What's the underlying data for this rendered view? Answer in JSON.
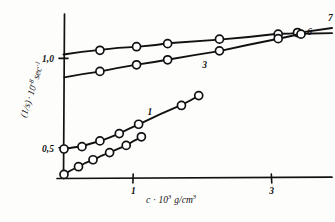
{
  "chart_data": {
    "type": "line",
    "title": "",
    "subtitle": "",
    "xlabel": "c · 10³ g/cm³",
    "ylabel": "(1/s) · 10⁻⁸ sec⁻¹",
    "xlabel_parts": {
      "c": "c",
      "dot": "·",
      "ten": "10",
      "exp": "3",
      "units": "g/cm",
      "units_exp": "3"
    },
    "ylabel_parts": {
      "frac": "(1/s)",
      "dot": "·",
      "ten": "10",
      "exp": "-8",
      "units": "sec",
      "units_exp": "-1"
    },
    "xlim": [
      0,
      3.85
    ],
    "ylim": [
      0.33,
      1.24
    ],
    "xticks": [
      1,
      3
    ],
    "xtick_labels": [
      "1",
      "3"
    ],
    "yticks": [
      0.5,
      1.0
    ],
    "ytick_labels": [
      "0,5",
      "1,0"
    ],
    "grid": false,
    "legend": "inline-end-labels",
    "series": [
      {
        "name": "7",
        "label": "7",
        "label_x": 3.82,
        "label_y": 1.205,
        "points": [
          {
            "x": 0.0,
            "y": 1.022
          },
          {
            "x": 0.52,
            "y": 1.043
          },
          {
            "x": 1.05,
            "y": 1.063
          },
          {
            "x": 1.5,
            "y": 1.08
          },
          {
            "x": 2.25,
            "y": 1.105
          },
          {
            "x": 3.1,
            "y": 1.133
          },
          {
            "x": 3.38,
            "y": 1.142
          }
        ]
      },
      {
        "name": "6",
        "label": "6",
        "label_x": 3.52,
        "label_y": 1.128,
        "points": [
          {
            "x": 0.0,
            "y": 0.893
          },
          {
            "x": 0.52,
            "y": 0.925
          },
          {
            "x": 1.05,
            "y": 0.962
          },
          {
            "x": 1.5,
            "y": 0.99
          },
          {
            "x": 2.25,
            "y": 1.04
          },
          {
            "x": 3.1,
            "y": 1.108
          },
          {
            "x": 3.43,
            "y": 1.133
          }
        ]
      },
      {
        "name": "3",
        "label": "3",
        "label_x": 2.0,
        "label_y": 0.945,
        "points": [
          {
            "x": 0.0,
            "y": 0.492
          },
          {
            "x": 0.26,
            "y": 0.505
          },
          {
            "x": 0.52,
            "y": 0.537
          },
          {
            "x": 0.8,
            "y": 0.578
          },
          {
            "x": 1.08,
            "y": 0.63
          },
          {
            "x": 1.7,
            "y": 0.735
          },
          {
            "x": 1.95,
            "y": 0.79
          }
        ]
      },
      {
        "name": "1",
        "label": "1",
        "label_x": 1.21,
        "label_y": 0.68,
        "points": [
          {
            "x": 0.0,
            "y": 0.35
          },
          {
            "x": 0.21,
            "y": 0.393
          },
          {
            "x": 0.42,
            "y": 0.432
          },
          {
            "x": 0.66,
            "y": 0.472
          },
          {
            "x": 0.9,
            "y": 0.512
          },
          {
            "x": 1.12,
            "y": 0.56
          }
        ]
      }
    ],
    "marker_radius": 4.0,
    "colors": {
      "ink": "#111111",
      "paper": "#fdfdfc",
      "marker_fill": "#ffffff"
    }
  }
}
